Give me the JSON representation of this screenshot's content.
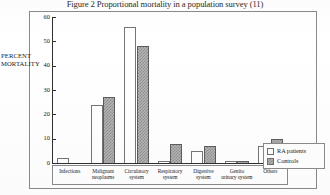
{
  "figure": {
    "caption": "Figure 2 Proportional mortality in a population survey (11)"
  },
  "axes": {
    "ylabel_line1": "PERCENT",
    "ylabel_line2": "MORTALITY",
    "yticks": [
      "0",
      "10",
      "20",
      "30",
      "40",
      "50",
      "60"
    ]
  },
  "legend": {
    "items": [
      {
        "label": "RA patients",
        "pattern": "open-white"
      },
      {
        "label": "Controls",
        "pattern": "checkered-grey"
      }
    ]
  },
  "chart_data": {
    "type": "bar",
    "title": "Figure 2 Proportional mortality in a population survey (11)",
    "xlabel": "",
    "ylabel": "PERCENT MORTALITY",
    "ylim": [
      0,
      60
    ],
    "ytick_values": [
      0,
      10,
      20,
      30,
      40,
      50,
      60
    ],
    "grid": false,
    "legend_position": "bottom-right",
    "categories": [
      "Infections",
      "Malignant neoplasms",
      "Circulatory system",
      "Respiratory system",
      "Digestive system",
      "Genito urinary system",
      "Others"
    ],
    "category_lines": [
      [
        "Infections",
        ""
      ],
      [
        "Malignant",
        "neoplasms"
      ],
      [
        "Circulatory",
        "system"
      ],
      [
        "Respiratory",
        "system"
      ],
      [
        "Digestive",
        "system"
      ],
      [
        "Genito",
        "urinary system"
      ],
      [
        "Others",
        ""
      ]
    ],
    "series": [
      {
        "name": "RA patients",
        "values": [
          2,
          24,
          56,
          1,
          5,
          1,
          7
        ]
      },
      {
        "name": "Controls",
        "values": [
          0,
          27,
          48,
          8,
          7,
          1,
          10
        ]
      }
    ]
  }
}
